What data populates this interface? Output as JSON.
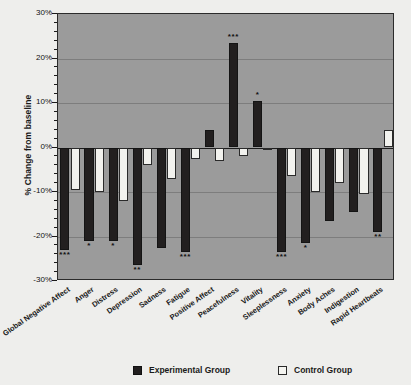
{
  "chart_data": {
    "type": "bar",
    "title": "",
    "xlabel": "",
    "ylabel": "% Change from baseline",
    "ylim": [
      -30,
      30
    ],
    "yticks": [
      30,
      20,
      10,
      0,
      -10,
      -20,
      -30
    ],
    "ytick_labels": [
      "30%",
      "20%",
      "10%",
      "0%",
      "-10%",
      "-20%",
      "-30%"
    ],
    "grid": true,
    "legend_position": "bottom",
    "categories": [
      "Global Negative Affect",
      "Anger",
      "Distress",
      "Depression",
      "Sadness",
      "Fatigue",
      "Positive Affect",
      "Peacefulness",
      "Vitality",
      "Sleeplessness",
      "Anxiety",
      "Body Aches",
      "Indigestion",
      "Rapid Heartbeats"
    ],
    "series": [
      {
        "name": "Experimental Group",
        "color": "#221f1f",
        "values": [
          -23.0,
          -21.0,
          -21.0,
          -26.5,
          -22.5,
          -23.5,
          4.0,
          23.5,
          10.5,
          -23.5,
          -21.5,
          -16.5,
          -14.5,
          -19.0
        ],
        "significance": [
          "***",
          "*",
          "*",
          "**",
          "",
          "***",
          "",
          "***",
          "*",
          "***",
          "*",
          "",
          "",
          "**"
        ]
      },
      {
        "name": "Control Group",
        "color": "#f2f2ee",
        "values": [
          -9.5,
          -10.0,
          -12.0,
          -4.0,
          -7.0,
          -2.5,
          -3.0,
          -2.0,
          -0.5,
          -6.5,
          -10.0,
          -8.0,
          -10.5,
          4.0
        ],
        "significance": [
          "",
          "",
          "",
          "",
          "",
          "",
          "",
          "",
          "",
          "",
          "",
          "",
          "",
          ""
        ]
      }
    ]
  },
  "legend": {
    "items": [
      {
        "label": "Experimental Group",
        "swatch": "filled-black-square"
      },
      {
        "label": "Control Group",
        "swatch": "outlined-white-square"
      }
    ]
  }
}
